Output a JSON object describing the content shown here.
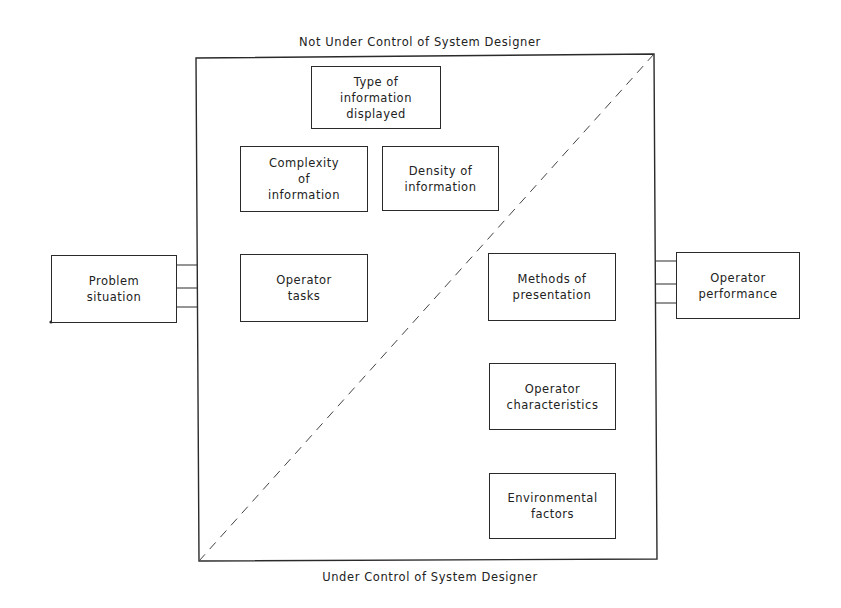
{
  "diagram": {
    "top_caption": "Not Under Control of System Designer",
    "bottom_caption": "Under Control of System Designer",
    "input": {
      "label": "Problem\nsituation"
    },
    "output": {
      "label": "Operator\nperformance"
    },
    "factors": [
      {
        "id": "type-of-information",
        "label": "Type of\ninformation\ndisplayed",
        "region": "not-under-control"
      },
      {
        "id": "complexity-of-information",
        "label": "Complexity\nof\ninformation",
        "region": "not-under-control"
      },
      {
        "id": "density-of-information",
        "label": "Density of\ninformation",
        "region": "not-under-control"
      },
      {
        "id": "operator-tasks",
        "label": "Operator\ntasks",
        "region": "not-under-control"
      },
      {
        "id": "methods-of-presentation",
        "label": "Methods of\npresentation",
        "region": "under-control"
      },
      {
        "id": "operator-characteristics",
        "label": "Operator\ncharacteristics",
        "region": "under-control"
      },
      {
        "id": "environmental-factors",
        "label": "Environmental\nfactors",
        "region": "under-control"
      }
    ],
    "colors": {
      "line": "#2a2a2a",
      "background": "#ffffff",
      "text": "#222222"
    }
  }
}
